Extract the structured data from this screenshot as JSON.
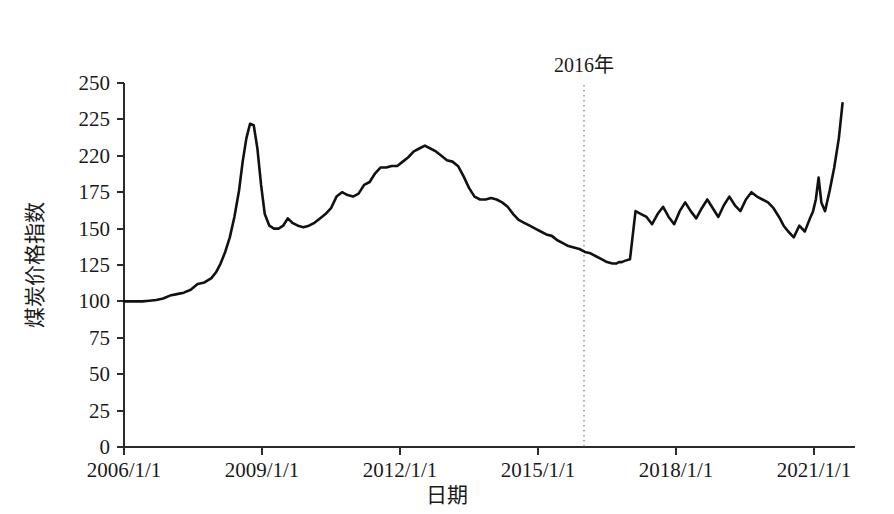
{
  "chart_data": {
    "type": "line",
    "title": "",
    "xlabel": "日期",
    "ylabel": "煤炭价格指数",
    "xlim": [
      "2006/1/1",
      "2021/8/1"
    ],
    "ylim": [
      0,
      250
    ],
    "grid": false,
    "legend": false,
    "y_ticks": [
      0,
      25,
      50,
      75,
      100,
      125,
      150,
      175,
      220,
      225,
      250
    ],
    "y_tick_labels": [
      "0",
      "25",
      "50",
      "75",
      "100",
      "125",
      "150",
      "175",
      "220",
      "225",
      "250"
    ],
    "y_tick_values_actual": [
      0,
      25,
      50,
      75,
      100,
      125,
      150,
      175,
      200,
      225,
      250
    ],
    "x_ticks": [
      "2006/1/1",
      "2009/1/1",
      "2012/1/1",
      "2015/1/1",
      "2018/1/1",
      "2021/1/1"
    ],
    "x_tick_years": [
      2006,
      2009,
      2012,
      2015,
      2018,
      2021
    ],
    "annotations": [
      {
        "name": "year-2016-marker",
        "label": "2016年",
        "x_year": 2016.0,
        "style": "dotted-vertical-line"
      }
    ],
    "series": [
      {
        "name": "煤炭价格指数",
        "color": "#111111",
        "x": [
          2006.0,
          2006.2,
          2006.4,
          2006.55,
          2006.7,
          2006.85,
          2007.0,
          2007.15,
          2007.3,
          2007.45,
          2007.6,
          2007.75,
          2007.9,
          2008.0,
          2008.1,
          2008.2,
          2008.3,
          2008.4,
          2008.5,
          2008.58,
          2008.66,
          2008.74,
          2008.82,
          2008.9,
          2008.98,
          2009.06,
          2009.16,
          2009.26,
          2009.36,
          2009.46,
          2009.56,
          2009.66,
          2009.78,
          2009.9,
          2010.02,
          2010.14,
          2010.26,
          2010.38,
          2010.5,
          2010.62,
          2010.74,
          2010.86,
          2010.98,
          2011.1,
          2011.22,
          2011.34,
          2011.46,
          2011.58,
          2011.7,
          2011.82,
          2011.94,
          2012.06,
          2012.18,
          2012.3,
          2012.42,
          2012.54,
          2012.66,
          2012.78,
          2012.9,
          2013.02,
          2013.14,
          2013.26,
          2013.38,
          2013.5,
          2013.62,
          2013.74,
          2013.86,
          2013.98,
          2014.1,
          2014.22,
          2014.34,
          2014.46,
          2014.58,
          2014.7,
          2014.82,
          2014.94,
          2015.06,
          2015.18,
          2015.3,
          2015.42,
          2015.54,
          2015.66,
          2015.78,
          2015.9,
          2016.02,
          2016.14,
          2016.26,
          2016.38,
          2016.5,
          2016.62,
          2016.7,
          2016.76,
          2016.82,
          2016.9,
          2017.0,
          2017.12,
          2017.24,
          2017.36,
          2017.48,
          2017.6,
          2017.72,
          2017.84,
          2017.96,
          2018.08,
          2018.2,
          2018.32,
          2018.44,
          2018.56,
          2018.68,
          2018.8,
          2018.92,
          2019.04,
          2019.16,
          2019.28,
          2019.4,
          2019.52,
          2019.64,
          2019.76,
          2019.88,
          2020.0,
          2020.12,
          2020.24,
          2020.34,
          2020.44,
          2020.56,
          2020.68,
          2020.8,
          2020.9,
          2020.98,
          2021.04,
          2021.1,
          2021.16,
          2021.24,
          2021.34,
          2021.44,
          2021.54,
          2021.62
        ],
        "y": [
          100,
          100,
          100,
          100.5,
          101,
          102,
          104,
          105,
          106,
          108,
          112,
          113,
          116,
          120,
          126,
          134,
          144,
          158,
          176,
          196,
          212,
          222,
          221,
          205,
          180,
          160,
          152,
          150,
          150,
          152,
          157,
          154,
          152,
          151,
          152,
          154,
          157,
          160,
          164,
          172,
          175,
          173,
          172,
          174,
          180,
          182,
          188,
          192,
          192,
          193,
          193,
          196,
          199,
          203,
          205,
          207,
          205,
          203,
          200,
          197,
          196,
          193,
          186,
          178,
          172,
          170,
          170,
          171,
          170,
          168,
          165,
          160,
          156,
          154,
          152,
          150,
          148,
          146,
          145,
          142,
          140,
          138,
          137,
          136,
          134,
          133,
          131,
          129,
          127,
          126,
          126,
          127,
          127,
          128,
          129,
          162,
          160,
          158,
          153,
          160,
          165,
          158,
          153,
          162,
          168,
          162,
          157,
          164,
          170,
          164,
          158,
          166,
          172,
          166,
          162,
          170,
          175,
          172,
          170,
          168,
          164,
          158,
          152,
          148,
          144,
          152,
          148,
          156,
          162,
          170,
          185,
          168,
          162,
          176,
          192,
          212,
          236
        ]
      }
    ]
  },
  "axis": {
    "y_title": "煤炭价格指数",
    "x_title": "日期"
  }
}
